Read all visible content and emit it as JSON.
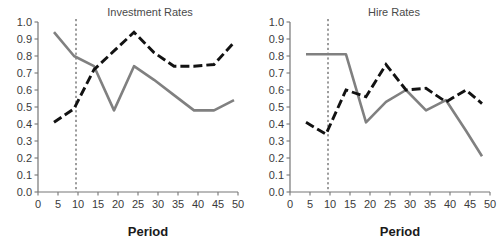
{
  "figure": {
    "panels": [
      {
        "id": "investment-rates",
        "title": "Investment Rates",
        "xlabel": "Period",
        "ylabel": ""
      },
      {
        "id": "hire-rates",
        "title": "Hire Rates",
        "xlabel": "Period",
        "ylabel": ""
      }
    ],
    "axis": {
      "xticks": [
        "0",
        "5",
        "10",
        "15",
        "20",
        "25",
        "30",
        "35",
        "40",
        "45",
        "50"
      ],
      "yticks": [
        "0.0",
        "0.1",
        "0.2",
        "0.3",
        "0.4",
        "0.5",
        "0.6",
        "0.7",
        "0.8",
        "0.9",
        "1.0"
      ]
    },
    "colors": {
      "gray_series": "#808080",
      "black_series": "#121212",
      "axis": "#767676",
      "vline": "#3a3a3a",
      "title": "#4a4a4a",
      "background": "#ffffff"
    },
    "annotations": {
      "vertical_reference_line_x": 9.5
    }
  },
  "chart_data": [
    {
      "type": "line",
      "title": "Investment Rates",
      "xlabel": "Period",
      "ylabel": "",
      "xlim": [
        0,
        50
      ],
      "ylim": [
        0,
        1
      ],
      "xticks": [
        0,
        5,
        10,
        15,
        20,
        25,
        30,
        35,
        40,
        45,
        50
      ],
      "yticks": [
        0.0,
        0.1,
        0.2,
        0.3,
        0.4,
        0.5,
        0.6,
        0.7,
        0.8,
        0.9,
        1.0
      ],
      "grid": false,
      "legend": "none",
      "annotations": [
        {
          "type": "vline",
          "x": 9.5,
          "style": "dashed"
        }
      ],
      "series": [
        {
          "name": "gray-solid",
          "style": "solid",
          "color": "#808080",
          "x": [
            4,
            9,
            14,
            19,
            24,
            29,
            34,
            39,
            44,
            49
          ],
          "values": [
            0.94,
            0.8,
            0.74,
            0.48,
            0.74,
            0.66,
            0.57,
            0.48,
            0.48,
            0.54
          ]
        },
        {
          "name": "black-dashed",
          "style": "dashed",
          "color": "#121212",
          "x": [
            4,
            9,
            14,
            19,
            24,
            29,
            34,
            39,
            44,
            49
          ],
          "values": [
            0.41,
            0.49,
            0.72,
            0.83,
            0.94,
            0.82,
            0.74,
            0.74,
            0.75,
            0.88
          ]
        }
      ]
    },
    {
      "type": "line",
      "title": "Hire Rates",
      "xlabel": "Period",
      "ylabel": "",
      "xlim": [
        0,
        50
      ],
      "ylim": [
        0,
        1
      ],
      "xticks": [
        0,
        5,
        10,
        15,
        20,
        25,
        30,
        35,
        40,
        45,
        50
      ],
      "yticks": [
        0.0,
        0.1,
        0.2,
        0.3,
        0.4,
        0.5,
        0.6,
        0.7,
        0.8,
        0.9,
        1.0
      ],
      "grid": false,
      "legend": "none",
      "annotations": [
        {
          "type": "vline",
          "x": 9.5,
          "style": "dashed"
        }
      ],
      "series": [
        {
          "name": "gray-solid",
          "style": "solid",
          "color": "#808080",
          "x": [
            4,
            9,
            14,
            19,
            24,
            29,
            34,
            39,
            44,
            48
          ],
          "values": [
            0.81,
            0.81,
            0.81,
            0.41,
            0.53,
            0.6,
            0.48,
            0.54,
            0.36,
            0.21
          ]
        },
        {
          "name": "black-dashed",
          "style": "dashed",
          "color": "#121212",
          "x": [
            4,
            9,
            14,
            19,
            24,
            29,
            34,
            39,
            44,
            48
          ],
          "values": [
            0.41,
            0.34,
            0.6,
            0.56,
            0.75,
            0.6,
            0.61,
            0.53,
            0.6,
            0.52
          ]
        }
      ]
    }
  ]
}
